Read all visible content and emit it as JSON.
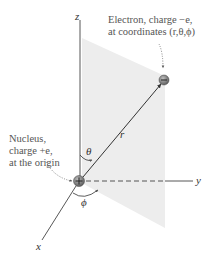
{
  "labels": {
    "electron_line1": "Electron, charge −e,",
    "electron_line2": "at coordinates (r,θ,ϕ)",
    "nucleus_line1": "Nucleus,",
    "nucleus_line2": "charge +e,",
    "nucleus_line3": "at the origin"
  },
  "axes": {
    "z": "z",
    "y": "y",
    "x": "x",
    "r": "r",
    "theta": "θ",
    "phi": "ϕ"
  },
  "symbols": {
    "electron_sign": "−",
    "nucleus_sign": "+"
  },
  "colors": {
    "plane": "#ececec",
    "axis": "#444444",
    "label": "#555555",
    "particle": "#8a8a8a"
  }
}
